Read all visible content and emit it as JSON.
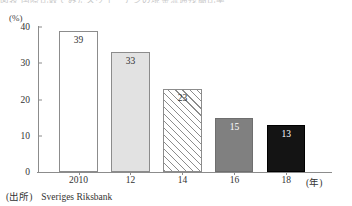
{
  "figure": {
    "title_cutoff": "図表 国際比較でみたスウェーデンの現金流通残高比率",
    "source_label": "(出所)",
    "source_text": "Sveriges Riksbank"
  },
  "chart_data": {
    "type": "bar",
    "title": "",
    "xlabel": "(年)",
    "ylabel": "(%)",
    "categories": [
      "2010",
      "12",
      "14",
      "16",
      "18"
    ],
    "values": [
      39,
      33,
      23,
      15,
      13
    ],
    "ylim": [
      0,
      40
    ],
    "yticks": [
      0,
      10,
      20,
      30,
      40
    ],
    "ytick_labels": [
      "0",
      "10",
      "20",
      "30",
      "40"
    ],
    "grid": false,
    "legend": "none",
    "bars": [
      {
        "category": "2010",
        "value": 39,
        "label": "39",
        "fill": "#ffffff",
        "border": "#8c8c8c",
        "label_color": "#333333",
        "pattern": "none"
      },
      {
        "category": "12",
        "value": 33,
        "label": "33",
        "fill": "#e2e2e2",
        "border": "#8c8c8c",
        "label_color": "#333333",
        "pattern": "none"
      },
      {
        "category": "14",
        "value": 23,
        "label": "23",
        "fill": "#ffffff",
        "border": "#8c8c8c",
        "label_color": "#333333",
        "pattern": "diagonal-hatch"
      },
      {
        "category": "16",
        "value": 15,
        "label": "15",
        "fill": "#808080",
        "border": "#6e6e6e",
        "label_color": "#ffffff",
        "pattern": "none"
      },
      {
        "category": "18",
        "value": 13,
        "label": "13",
        "fill": "#141414",
        "border": "#000000",
        "label_color": "#ffffff",
        "pattern": "none"
      }
    ]
  }
}
